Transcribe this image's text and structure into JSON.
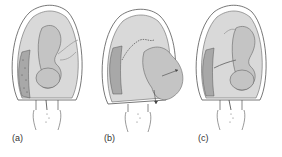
{
  "figure": {
    "panels": [
      {
        "id": "a",
        "label": "(a)",
        "description": "uterus with fetus, placenta on left wall"
      },
      {
        "id": "b",
        "label": "(b)",
        "description": "uterus with fetus and placenta, membrane detaching, part protruding through wall"
      },
      {
        "id": "c",
        "label": "(c)",
        "description": "uterus with fetus, placenta on left wall, cord visible"
      }
    ]
  },
  "colors": {
    "outline": "#555555",
    "uterus_fill": "#d9d9d9",
    "fetus_fill": "#c4c4c4",
    "placenta_fill": "#a8a8a8",
    "background": "#ffffff"
  }
}
